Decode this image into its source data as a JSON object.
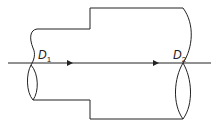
{
  "diagram": {
    "type": "pipe-expansion",
    "labels": {
      "d1": {
        "main": "D",
        "sub": "1"
      },
      "d2": {
        "main": "D",
        "sub": "2"
      }
    },
    "flow_direction": "left-to-right",
    "arrows": 2,
    "colors": {
      "stroke": "#222222",
      "background": "#ffffff"
    }
  }
}
